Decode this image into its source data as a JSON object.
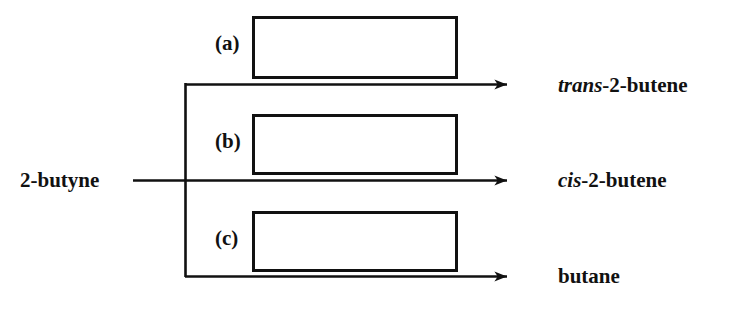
{
  "diagram": {
    "type": "reaction-scheme",
    "reactant": {
      "name": "2-butyne"
    },
    "steps": [
      {
        "id": "a",
        "label": "(a)",
        "reagent_text": ""
      },
      {
        "id": "b",
        "label": "(b)",
        "reagent_text": ""
      },
      {
        "id": "c",
        "label": "(c)",
        "reagent_text": ""
      }
    ],
    "products": [
      {
        "id": "trans-2-butene",
        "italic_part": "trans",
        "rest_part": "-2-butene"
      },
      {
        "id": "cis-2-butene",
        "italic_part": "cis",
        "rest_part": "-2-butene"
      },
      {
        "id": "butane",
        "italic_part": "",
        "rest_part": "butane"
      }
    ],
    "colors": {
      "ink": "#111111",
      "background": "#ffffff"
    }
  }
}
